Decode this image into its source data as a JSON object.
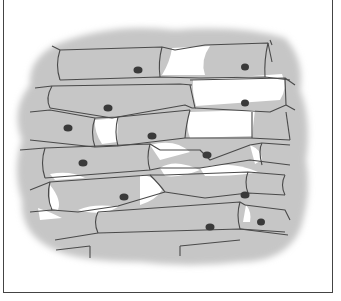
{
  "figure": {
    "colors": {
      "cytoplasm": "#c4c4c4",
      "cell_wall": "#4a4a4a",
      "background": "#ffffff",
      "nucleus": "#3a3a3a",
      "frame": "#444444"
    },
    "nuclei": [
      {
        "x": 138,
        "y": 70
      },
      {
        "x": 245,
        "y": 67
      },
      {
        "x": 108,
        "y": 108
      },
      {
        "x": 245,
        "y": 103
      },
      {
        "x": 68,
        "y": 128
      },
      {
        "x": 152,
        "y": 136
      },
      {
        "x": 83,
        "y": 163
      },
      {
        "x": 207,
        "y": 155
      },
      {
        "x": 124,
        "y": 197
      },
      {
        "x": 245,
        "y": 195
      },
      {
        "x": 210,
        "y": 227
      },
      {
        "x": 261,
        "y": 222
      }
    ]
  }
}
